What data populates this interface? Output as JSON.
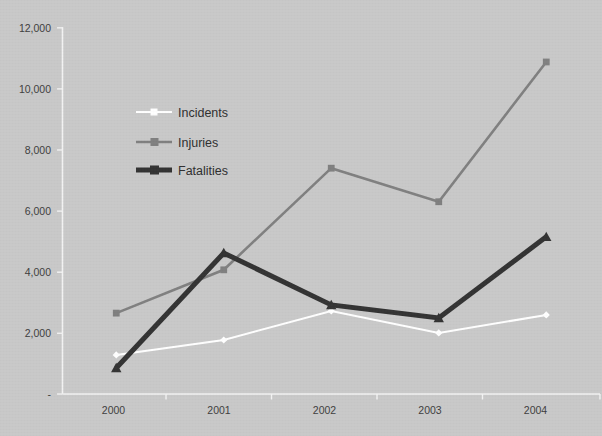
{
  "chart_data": {
    "type": "line",
    "title": "",
    "subtitle": "",
    "xlabel": "",
    "ylabel": "",
    "categories": [
      "2000",
      "2001",
      "2002",
      "2003",
      "2004"
    ],
    "series": [
      {
        "name": "Incidents",
        "color": "#ffffff",
        "line_width": 2,
        "marker": "diamond",
        "values": [
          1280,
          1770,
          2720,
          2000,
          2590
        ]
      },
      {
        "name": "Injuries",
        "color": "#808080",
        "line_width": 2.6,
        "marker": "square",
        "values": [
          2650,
          4070,
          7400,
          6300,
          10880
        ]
      },
      {
        "name": "Fatalities",
        "color": "#333333",
        "line_width": 5,
        "marker": "triangle",
        "values": [
          850,
          4620,
          2920,
          2490,
          5150
        ]
      }
    ],
    "ylim": [
      0,
      12000
    ],
    "ytick_values": [
      0,
      2000,
      4000,
      6000,
      8000,
      10000,
      12000
    ],
    "ytick_labels": [
      "-",
      "2,000",
      "4,000",
      "6,000",
      "8,000",
      "10,000",
      "12,000"
    ],
    "grid": false,
    "legend_position": "inside-upper-left",
    "background_color": "#c9c9c9",
    "axis_color": "#f2f2f2",
    "tick_label_color": "#3d3d3d"
  },
  "legend": {
    "entries": [
      {
        "label": "Incidents"
      },
      {
        "label": "Injuries"
      },
      {
        "label": "Fatalities"
      }
    ]
  },
  "axes": {
    "y_tick_labels": [
      "12,000",
      "10,000",
      "8,000",
      "6,000",
      "4,000",
      "2,000",
      "-"
    ],
    "x_tick_labels": [
      "2000",
      "2001",
      "2002",
      "2003",
      "2004"
    ]
  }
}
